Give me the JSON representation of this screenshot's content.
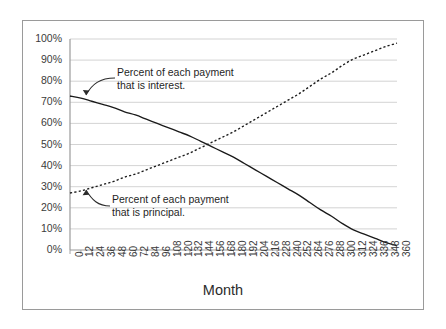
{
  "chart_data": {
    "type": "line",
    "title": "",
    "xlabel": "Month",
    "ylabel": "",
    "xlim": [
      0,
      360
    ],
    "ylim": [
      0,
      100
    ],
    "grid": true,
    "legend_position": "none",
    "x_tick_labels": [
      "0",
      "12",
      "24",
      "36",
      "48",
      "60",
      "72",
      "84",
      "96",
      "108",
      "120",
      "132",
      "144",
      "156",
      "168",
      "180",
      "192",
      "204",
      "216",
      "228",
      "240",
      "252",
      "264",
      "276",
      "288",
      "300",
      "312",
      "324",
      "336",
      "348",
      "360"
    ],
    "y_tick_labels": [
      "0%",
      "10%",
      "20%",
      "30%",
      "40%",
      "50%",
      "60%",
      "70%",
      "80%",
      "90%",
      "100%"
    ],
    "x": [
      0,
      12,
      24,
      36,
      48,
      60,
      72,
      84,
      96,
      108,
      120,
      132,
      144,
      156,
      168,
      180,
      192,
      204,
      216,
      228,
      240,
      252,
      264,
      276,
      288,
      300,
      312,
      324,
      336,
      348,
      360
    ],
    "series": [
      {
        "name": "Percent of each payment that is interest",
        "style": "solid",
        "color": "#1a1a1a",
        "values": [
          73,
          72,
          70.5,
          69,
          67.5,
          65.5,
          64,
          62,
          60,
          58,
          56,
          54,
          51.5,
          49,
          46.5,
          44,
          41,
          38,
          35,
          32,
          29,
          26,
          22.5,
          19,
          16,
          12.5,
          9.5,
          7.5,
          5.5,
          3.5,
          2
        ]
      },
      {
        "name": "Percent of each payment that is principal",
        "style": "dotted",
        "color": "#1a1a1a",
        "values": [
          27,
          28,
          29.5,
          31,
          32.5,
          34.5,
          36,
          38,
          40,
          42,
          44,
          46,
          48.5,
          51,
          53.5,
          56,
          59,
          62,
          65,
          68,
          71,
          74,
          77.5,
          81,
          84,
          87.5,
          90.5,
          92.5,
          94.5,
          96.5,
          98
        ]
      }
    ],
    "annotations": [
      {
        "name": "interest-annotation",
        "line1": "Percent of each payment",
        "line2": "that is interest."
      },
      {
        "name": "principal-annotation",
        "line1": "Percent of each payment",
        "line2": "that is principal."
      }
    ],
    "crossover": {
      "month": 168,
      "percent": 51
    },
    "colors": {
      "grid": "#c8c8c8",
      "axis": "#9a9a9a",
      "border": "#9a9a9a",
      "text": "#3b3b3b",
      "series": "#1a1a1a"
    }
  }
}
